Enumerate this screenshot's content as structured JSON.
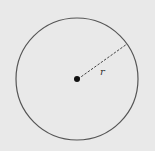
{
  "diagram": {
    "radius_label": "r",
    "colors": {
      "background": "#e9e9e9",
      "circle_stroke": "#555555",
      "center_dot": "#111111",
      "radius_line": "#444444"
    }
  }
}
